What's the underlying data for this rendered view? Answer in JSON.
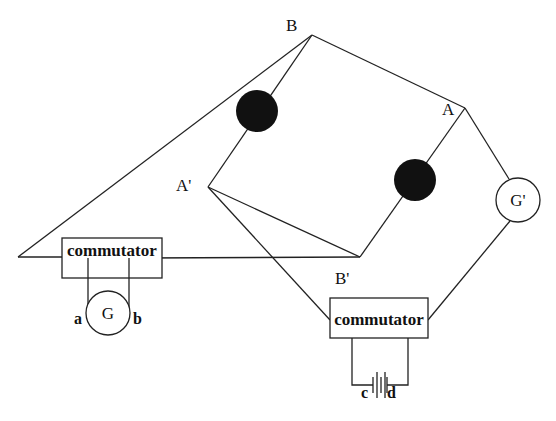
{
  "diagram": {
    "nodes": {
      "B": "B",
      "A": "A",
      "A_prime": "A'",
      "B_prime": "B'"
    },
    "components": {
      "left_commutator": "commutator",
      "right_commutator": "commutator",
      "galvanometer_G": "G",
      "galvanometer_G_prime": "G'"
    },
    "terminals": {
      "a": "a",
      "b": "b",
      "c": "c",
      "d": "d"
    },
    "element_colors": {
      "wire": "#222222",
      "resistor_fill": "#111111",
      "background": "#ffffff"
    }
  }
}
